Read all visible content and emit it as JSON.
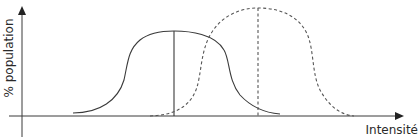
{
  "diagram": {
    "type": "distribution-shift",
    "y_axis_label": "% population",
    "x_axis_label": "Intensité",
    "curves": [
      {
        "name": "distribution-1",
        "style": "solid",
        "peak_position": "center-left",
        "has_mean_line": true
      },
      {
        "name": "distribution-2",
        "style": "dashed",
        "peak_position": "center-right",
        "has_mean_line": true,
        "relative_peak": "higher"
      }
    ]
  }
}
